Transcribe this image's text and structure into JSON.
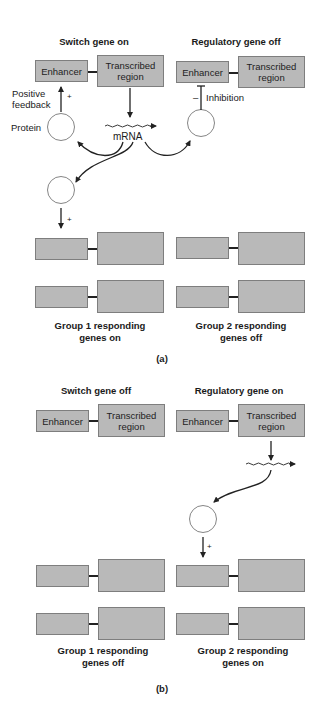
{
  "panel_a": {
    "label": "(a)",
    "left_title": "Switch gene on",
    "right_title": "Regulatory gene off",
    "enhancer": "Enhancer",
    "transcribed": [
      "Transcribed",
      "region"
    ],
    "positive_feedback": [
      "Positive",
      "feedback"
    ],
    "plus": "+",
    "minus": "–",
    "protein": "Protein",
    "mrna": "mRNA",
    "inhibition": "Inhibition",
    "group1": [
      "Group 1 responding",
      "genes on"
    ],
    "group2": [
      "Group 2 responding",
      "genes off"
    ]
  },
  "panel_b": {
    "label": "(b)",
    "left_title": "Switch gene off",
    "right_title": "Regulatory gene on",
    "enhancer": "Enhancer",
    "transcribed": [
      "Transcribed",
      "region"
    ],
    "plus": "+",
    "group1": [
      "Group 1 responding",
      "genes off"
    ],
    "group2": [
      "Group 2 responding",
      "genes on"
    ]
  },
  "colors": {
    "box_fill": "#b9b9b9",
    "box_border": "#7e7e7e",
    "line": "#222222"
  }
}
